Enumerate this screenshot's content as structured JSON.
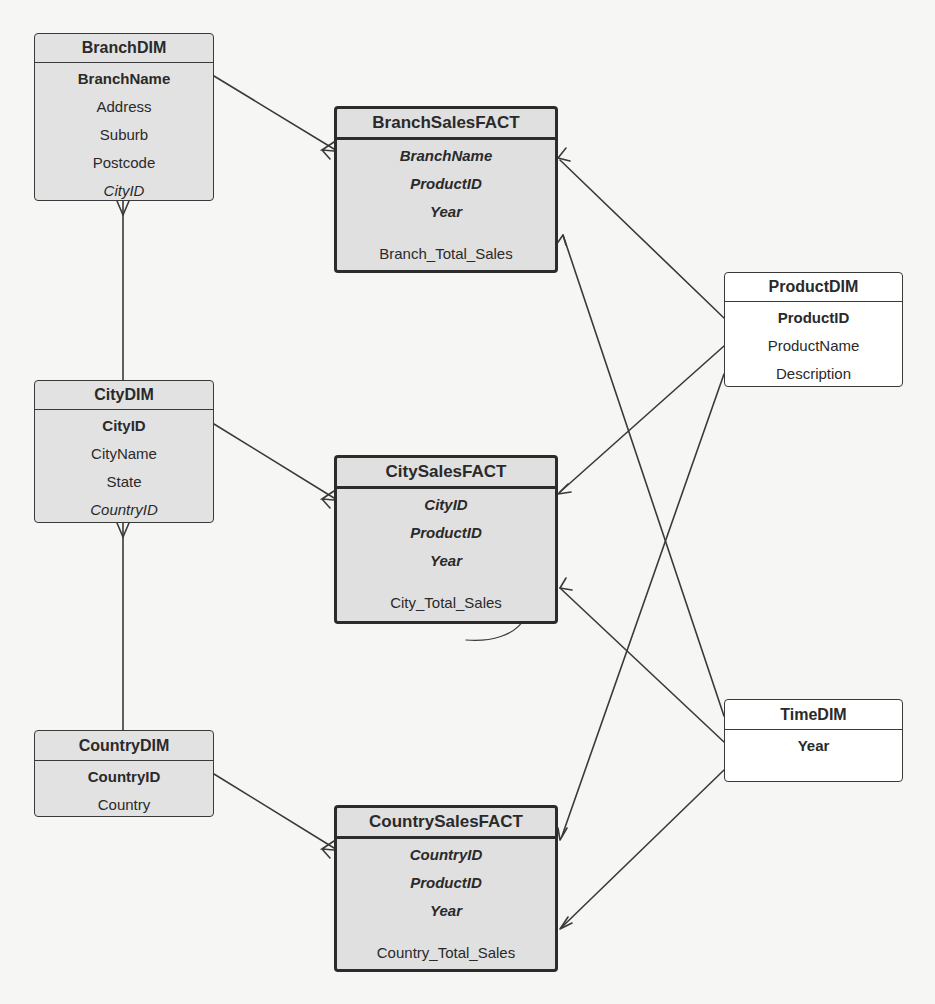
{
  "diagram": {
    "type": "star-schema ER diagram",
    "colors": {
      "paper": "#f6f6f4",
      "box_fill": "#e2e2e2",
      "line": "#3a3a3a",
      "white_box": "#ffffff"
    }
  },
  "entities": {
    "branch_dim": {
      "title": "BranchDIM",
      "attrs": [
        "BranchName",
        "Address",
        "Suburb",
        "Postcode",
        "CityID"
      ]
    },
    "branch_sales_fact": {
      "title": "BranchSalesFACT",
      "keys": [
        "BranchName",
        "ProductID",
        "Year"
      ],
      "measure": "Branch_Total_Sales"
    },
    "product_dim": {
      "title": "ProductDIM",
      "attrs": [
        "ProductID",
        "ProductName",
        "Description"
      ]
    },
    "city_dim": {
      "title": "CityDIM",
      "attrs": [
        "CityID",
        "CityName",
        "State",
        "CountryID"
      ]
    },
    "city_sales_fact": {
      "title": "CitySalesFACT",
      "keys": [
        "CityID",
        "ProductID",
        "Year"
      ],
      "measure": "City_Total_Sales"
    },
    "country_dim": {
      "title": "CountryDIM",
      "attrs": [
        "CountryID",
        "Country"
      ]
    },
    "country_sales_fact": {
      "title": "CountrySalesFACT",
      "keys": [
        "CountryID",
        "ProductID",
        "Year"
      ],
      "measure": "Country_Total_Sales"
    },
    "time_dim": {
      "title": "TimeDIM",
      "attrs": [
        "Year"
      ]
    }
  },
  "relationships": [
    {
      "from": "BranchDIM",
      "to": "BranchSalesFACT",
      "cardinality": "one-to-many"
    },
    {
      "from": "CityDIM",
      "to": "CitySalesFACT",
      "cardinality": "one-to-many"
    },
    {
      "from": "CountryDIM",
      "to": "CountrySalesFACT",
      "cardinality": "one-to-many"
    },
    {
      "from": "CityDIM",
      "to": "BranchDIM",
      "cardinality": "one-to-many"
    },
    {
      "from": "CountryDIM",
      "to": "CityDIM",
      "cardinality": "one-to-many"
    },
    {
      "from": "ProductDIM",
      "to": "BranchSalesFACT",
      "cardinality": "one-to-many"
    },
    {
      "from": "ProductDIM",
      "to": "CitySalesFACT",
      "cardinality": "one-to-many"
    },
    {
      "from": "ProductDIM",
      "to": "CountrySalesFACT",
      "cardinality": "one-to-many"
    },
    {
      "from": "TimeDIM",
      "to": "BranchSalesFACT",
      "cardinality": "one-to-many"
    },
    {
      "from": "TimeDIM",
      "to": "CitySalesFACT",
      "cardinality": "one-to-many"
    },
    {
      "from": "TimeDIM",
      "to": "CountrySalesFACT",
      "cardinality": "one-to-many"
    }
  ]
}
